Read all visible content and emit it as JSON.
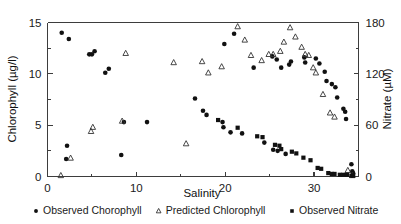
{
  "chart_data": {
    "type": "scatter",
    "title": "",
    "xlabel": "Salinity",
    "ylabel": "Chlorophyll (µg/l)",
    "y2label": "Nitrate (µM)",
    "xlim": [
      0,
      35
    ],
    "ylim": [
      0,
      15
    ],
    "y2lim": [
      0,
      180
    ],
    "xticks": [
      0,
      10,
      20,
      30
    ],
    "xticklabels": [
      "0",
      "10",
      "20",
      "30"
    ],
    "yticks": [
      0,
      5,
      10,
      15
    ],
    "yticklabels": [
      "0",
      "5",
      "10",
      "15"
    ],
    "y2ticks": [
      0,
      60,
      120,
      180
    ],
    "y2ticklabels": [
      "0",
      "60",
      "120",
      "180"
    ],
    "xminorticks": [
      5,
      15,
      25
    ],
    "yminorticks": [
      2.5,
      7.5,
      12.5
    ],
    "y2minorticks": [
      30,
      90,
      150
    ],
    "grid": false,
    "legend_position": "bottom",
    "series": [
      {
        "name": "Observed Chorophyll",
        "marker": "filled-circle",
        "axis": "left",
        "points": [
          [
            1.6,
            14.0
          ],
          [
            2.4,
            13.4
          ],
          [
            2.1,
            1.7
          ],
          [
            2.2,
            3.0
          ],
          [
            4.7,
            11.9
          ],
          [
            5.0,
            11.9
          ],
          [
            5.3,
            12.2
          ],
          [
            6.5,
            10.1
          ],
          [
            6.9,
            10.5
          ],
          [
            8.3,
            2.1
          ],
          [
            8.6,
            5.3
          ],
          [
            11.2,
            5.3
          ],
          [
            16.6,
            7.6
          ],
          [
            17.5,
            6.4
          ],
          [
            17.9,
            6.0
          ],
          [
            19.9,
            12.9
          ],
          [
            21.0,
            13.9
          ],
          [
            19.7,
            5.3
          ],
          [
            19.8,
            4.8
          ],
          [
            20.6,
            4.3
          ],
          [
            21.9,
            4.2
          ],
          [
            23.2,
            10.6
          ],
          [
            25.3,
            11.7
          ],
          [
            25.8,
            11.4
          ],
          [
            24.4,
            3.3
          ],
          [
            25.4,
            2.6
          ],
          [
            25.9,
            2.5
          ],
          [
            26.8,
            2.2
          ],
          [
            26.3,
            10.6
          ],
          [
            27.2,
            10.9
          ],
          [
            27.4,
            11.2
          ],
          [
            28.9,
            11.6
          ],
          [
            29.0,
            11.1
          ],
          [
            30.2,
            11.5
          ],
          [
            30.6,
            11.0
          ],
          [
            31.2,
            10.2
          ],
          [
            31.4,
            9.3
          ],
          [
            32.0,
            9.0
          ],
          [
            32.4,
            8.7
          ],
          [
            32.6,
            7.7
          ],
          [
            33.3,
            6.6
          ],
          [
            33.5,
            6.3
          ],
          [
            33.6,
            5.6
          ],
          [
            34.2,
            1.2
          ],
          [
            34.3,
            0.5
          ],
          [
            34.4,
            0.3
          ]
        ]
      },
      {
        "name": "Predicted Chlorophyll",
        "marker": "open-triangle",
        "axis": "left",
        "points": [
          [
            1.5,
            0.1
          ],
          [
            2.6,
            1.8
          ],
          [
            4.9,
            4.4
          ],
          [
            5.1,
            4.8
          ],
          [
            8.4,
            5.4
          ],
          [
            8.8,
            12.0
          ],
          [
            14.2,
            11.1
          ],
          [
            15.6,
            3.2
          ],
          [
            17.4,
            11.2
          ],
          [
            18.1,
            10.1
          ],
          [
            19.6,
            10.7
          ],
          [
            21.4,
            14.6
          ],
          [
            22.2,
            13.3
          ],
          [
            22.9,
            11.8
          ],
          [
            24.1,
            11.3
          ],
          [
            24.9,
            11.9
          ],
          [
            25.4,
            11.9
          ],
          [
            26.2,
            12.2
          ],
          [
            26.6,
            13.1
          ],
          [
            27.3,
            14.5
          ],
          [
            27.9,
            13.6
          ],
          [
            28.6,
            12.6
          ],
          [
            29.0,
            11.9
          ],
          [
            29.4,
            11.8
          ],
          [
            29.9,
            10.6
          ],
          [
            30.2,
            10.1
          ],
          [
            31.0,
            8.0
          ],
          [
            31.8,
            6.2
          ],
          [
            32.3,
            5.8
          ],
          [
            33.8,
            0.6
          ],
          [
            34.3,
            0.1
          ]
        ]
      },
      {
        "name": "Observed Nitrate",
        "marker": "filled-square",
        "axis": "right",
        "points": [
          [
            19.2,
            66.0
          ],
          [
            21.4,
            57.0
          ],
          [
            23.6,
            47.0
          ],
          [
            24.2,
            46.0
          ],
          [
            25.6,
            37.0
          ],
          [
            26.1,
            36.0
          ],
          [
            26.3,
            32.0
          ],
          [
            27.5,
            29.0
          ],
          [
            28.0,
            27.0
          ],
          [
            28.8,
            22.0
          ],
          [
            29.6,
            19.0
          ],
          [
            30.4,
            10.0
          ],
          [
            30.8,
            9.0
          ],
          [
            31.6,
            4.0
          ],
          [
            32.0,
            3.0
          ],
          [
            32.3,
            3.0
          ],
          [
            32.9,
            2.0
          ],
          [
            33.3,
            2.0
          ],
          [
            33.7,
            2.0
          ],
          [
            34.2,
            1.0
          ],
          [
            34.4,
            1.0
          ]
        ]
      }
    ]
  },
  "legend": {
    "items": [
      {
        "label": "Observed Chorophyll",
        "marker": "filled-circle"
      },
      {
        "label": "Predicted Chlorophyll",
        "marker": "open-triangle"
      },
      {
        "label": "Observed Nitrate",
        "marker": "filled-square"
      }
    ]
  },
  "axes": {
    "x_title": "Salinity",
    "y_left_title": "Chlorophyll (µg/l)",
    "y_right_title": "Nitrate (µM)"
  }
}
